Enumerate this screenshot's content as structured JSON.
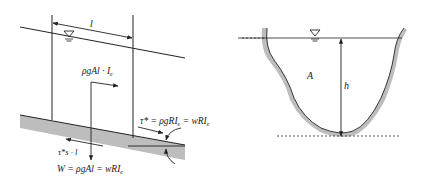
{
  "left_panel": {
    "length_label": "l",
    "driving_force": "ρgAl · I",
    "driving_force_sub": "e",
    "shear_label": "τ* = ρgRI",
    "shear_label_sub": "e",
    "shear_label_tail": " = wRI",
    "shear_label_tail_sub": "e",
    "friction_label": "τ*s · l",
    "weight_label": "W = ρgAl = wRI",
    "weight_label_sub": "e",
    "water_surface_symbol": "▽"
  },
  "right_panel": {
    "area_label": "A",
    "depth_label": "h",
    "water_surface_symbol": "▽"
  },
  "colors": {
    "line": "#222222",
    "bed_fill": "#bdbdbd"
  }
}
